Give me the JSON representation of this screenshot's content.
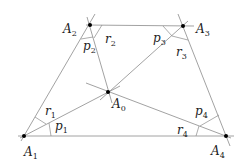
{
  "diagram": {
    "title": "",
    "points": [
      {
        "id": "A0",
        "name": "A",
        "sub": "0",
        "x": 108,
        "y": 92,
        "lx": 112,
        "ly": 108
      },
      {
        "id": "A1",
        "name": "A",
        "sub": "1",
        "x": 24,
        "y": 136,
        "lx": 24,
        "ly": 156
      },
      {
        "id": "A2",
        "name": "A",
        "sub": "2",
        "x": 90,
        "y": 25,
        "lx": 63,
        "ly": 33
      },
      {
        "id": "A3",
        "name": "A",
        "sub": "3",
        "x": 183,
        "y": 26,
        "lx": 196,
        "ly": 33
      },
      {
        "id": "A4",
        "name": "A",
        "sub": "4",
        "x": 226,
        "y": 136,
        "lx": 211,
        "ly": 155
      }
    ],
    "angle_labels": [
      {
        "id": "p1",
        "name": "p",
        "sub": "1",
        "x": 55,
        "y": 130
      },
      {
        "id": "r1",
        "name": "r",
        "sub": "1",
        "x": 45,
        "y": 115
      },
      {
        "id": "p2",
        "name": "p",
        "sub": "2",
        "x": 83,
        "y": 50
      },
      {
        "id": "r2",
        "name": "r",
        "sub": "2",
        "x": 105,
        "y": 43
      },
      {
        "id": "p3",
        "name": "p",
        "sub": "3",
        "x": 153,
        "y": 42
      },
      {
        "id": "r3",
        "name": "r",
        "sub": "3",
        "x": 176,
        "y": 56
      },
      {
        "id": "p4",
        "name": "p",
        "sub": "4",
        "x": 195,
        "y": 115
      },
      {
        "id": "r4",
        "name": "r",
        "sub": "4",
        "x": 177,
        "y": 134
      }
    ],
    "edges": [
      [
        "A1",
        "A2"
      ],
      [
        "A2",
        "A3"
      ],
      [
        "A3",
        "A4"
      ],
      [
        "A4",
        "A1"
      ]
    ],
    "spokes": [
      [
        "A0",
        "A1"
      ],
      [
        "A0",
        "A2"
      ],
      [
        "A0",
        "A3"
      ],
      [
        "A0",
        "A4"
      ]
    ]
  }
}
